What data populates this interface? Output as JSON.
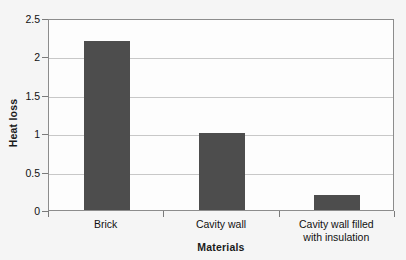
{
  "chart_data": {
    "type": "bar",
    "title": "",
    "categories": [
      "Brick",
      "Cavity wall",
      "Cavity wall filled with insulation"
    ],
    "category_lines": [
      [
        "Brick"
      ],
      [
        "Cavity wall"
      ],
      [
        "Cavity wall filled",
        "with insulation"
      ]
    ],
    "values": [
      2.2,
      1.0,
      0.2
    ],
    "xlabel": "Materials",
    "ylabel": "Heat loss",
    "ylim": [
      0,
      2.5
    ],
    "yticks": [
      0,
      0.5,
      1,
      1.5,
      2,
      2.5
    ],
    "ytick_labels": [
      "0",
      "0.5",
      "1",
      "1.5",
      "2",
      "2.5"
    ],
    "grid": true,
    "legend": false,
    "bar_color": "#4d4d4d",
    "grid_color": "#c8c8c8",
    "frame_color": "#8c8c8c",
    "plot_background": "#fdfdfd",
    "page_background": "#f5f5f5"
  },
  "title_fragment": "",
  "axes": {
    "y_title": "Heat loss",
    "x_title": "Materials"
  }
}
